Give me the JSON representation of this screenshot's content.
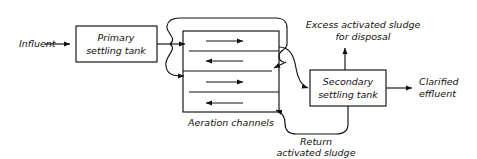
{
  "diagram": {
    "stroke_color": "#111111",
    "background_color": "#ffffff",
    "nodes": {
      "primary_tank": {
        "line1": "Primary",
        "line2": "settling tank"
      },
      "aeration": {
        "label": "Aeration channels",
        "channel_count": 4,
        "channel_flow_directions": [
          "right",
          "left",
          "right",
          "left"
        ]
      },
      "secondary_tank": {
        "line1": "Secondary",
        "line2": "settling tank"
      }
    },
    "streams": {
      "influent": "Influent",
      "excess_sludge_line1": "Excess activated sludge",
      "excess_sludge_line2": "for disposal",
      "clarified_line1": "Clarified",
      "clarified_line2": "effluent",
      "return_line1": "Return",
      "return_line2": "activated sludge"
    }
  }
}
